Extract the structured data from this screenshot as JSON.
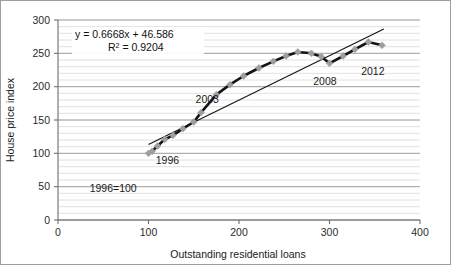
{
  "figure": {
    "background_color": "#ffffff",
    "border_color": "#9a9a9a"
  },
  "chart_data": {
    "type": "scatter",
    "title": "",
    "subtitle": "",
    "xlabel": "Outstanding residential loans",
    "ylabel": "House price index",
    "xlim": [
      0,
      400
    ],
    "ylim": [
      0,
      300
    ],
    "xticks": [
      "0",
      "100",
      "200",
      "300",
      "400"
    ],
    "xtick_values": [
      0,
      100,
      200,
      300,
      400
    ],
    "yticks": [
      "0",
      "50",
      "100",
      "150",
      "200",
      "250",
      "300"
    ],
    "ytick_values": [
      0,
      50,
      100,
      150,
      200,
      250,
      300
    ],
    "grid": true,
    "grid_minor_step": 10,
    "grid_major_step": 50,
    "legend": false,
    "legend_position": "none",
    "series": [
      {
        "name": "House price index vs outstanding residential loans",
        "marker": "diamond",
        "marker_color": "#9e9e9e",
        "line_color": "#141414",
        "x": [
          100,
          104,
          110,
          118,
          127,
          138,
          150,
          158,
          175,
          190,
          205,
          222,
          238,
          252,
          265,
          280,
          291,
          300,
          315,
          328,
          343,
          358
        ],
        "y": [
          100,
          103,
          111,
          121,
          127,
          137,
          147,
          161,
          188,
          203,
          216,
          228,
          238,
          246,
          252,
          250,
          245,
          235,
          246,
          256,
          267,
          262
        ]
      }
    ],
    "trendline": {
      "equation": "y = 0.6668x + 46.586",
      "r_squared_label": "R",
      "r_squared_sup": "2",
      "r_squared_value": "= 0.9204",
      "slope": 0.6668,
      "intercept": 46.586,
      "color": "#141414",
      "x_start": 100,
      "x_end": 360
    },
    "annotations": [
      {
        "text": "1996",
        "x": 108,
        "y": 84,
        "name": "annotation-1996"
      },
      {
        "text": "2003",
        "x": 152,
        "y": 176,
        "name": "annotation-2003"
      },
      {
        "text": "2008",
        "x": 282,
        "y": 203,
        "name": "annotation-2008"
      },
      {
        "text": "2012",
        "x": 335,
        "y": 217,
        "name": "annotation-2012"
      },
      {
        "text": "1996=100",
        "x": 35,
        "y": 42,
        "name": "annotation-base-note"
      }
    ]
  },
  "equation_box": {
    "line1": "y = 0.6668x + 46.586",
    "line2_prefix": "R",
    "line2_sup": "2",
    "line2_suffix": " = 0.9204"
  },
  "axes": {
    "x_title": "Outstanding residential loans",
    "y_title": "House price index",
    "x_ticks": [
      "0",
      "100",
      "200",
      "300",
      "400"
    ],
    "y_ticks": [
      "300",
      "250",
      "200",
      "150",
      "100",
      "50",
      "0"
    ]
  }
}
